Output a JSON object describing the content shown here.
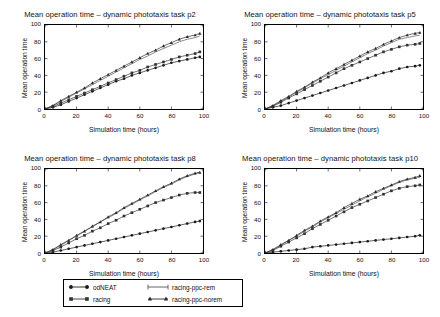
{
  "figure": {
    "axis_labels": {
      "x": "Simulation time (hours)",
      "y": "Mean operation time"
    },
    "xticks": [
      "0",
      "20",
      "40",
      "60",
      "80",
      "100"
    ],
    "yticks": [
      "0",
      "20",
      "40",
      "60",
      "80",
      "100"
    ]
  },
  "legend": {
    "entries": [
      {
        "label": "odNEAT",
        "marker": "filled-circle",
        "color": "#1a1a1a"
      },
      {
        "label": "racing",
        "marker": "filled-square",
        "color": "#333333"
      },
      {
        "label": "racing-ppc-rem",
        "marker": "line-only",
        "color": "#555555"
      },
      {
        "label": "racing-ppc-norem",
        "marker": "filled-triangle",
        "color": "#2b2b2b"
      }
    ]
  },
  "chart_data": [
    {
      "type": "line",
      "title": "Mean operation time – dynamic phototaxis task p2",
      "xlabel": "Simulation time (hours)",
      "ylabel": "Mean operation time",
      "xlim": [
        0,
        100
      ],
      "ylim": [
        0,
        100
      ],
      "grid": false,
      "legend_position": "below-figure",
      "x": [
        0,
        5,
        10,
        15,
        20,
        25,
        30,
        35,
        40,
        45,
        50,
        55,
        60,
        65,
        70,
        75,
        80,
        85,
        90,
        95,
        98
      ],
      "series": [
        {
          "name": "odNEAT",
          "values": [
            0,
            2,
            5,
            9,
            13,
            17,
            21,
            25,
            29,
            33,
            36,
            40,
            43,
            46,
            49,
            52,
            55,
            57,
            59,
            61,
            62
          ]
        },
        {
          "name": "racing",
          "values": [
            0,
            3,
            7,
            11,
            15,
            19,
            23,
            27,
            31,
            35,
            39,
            43,
            46,
            50,
            53,
            56,
            59,
            62,
            64,
            66,
            68
          ]
        },
        {
          "name": "racing-ppc-rem",
          "values": [
            0,
            4,
            9,
            14,
            19,
            24,
            29,
            34,
            39,
            44,
            49,
            54,
            59,
            63,
            68,
            72,
            76,
            80,
            83,
            85,
            87
          ]
        },
        {
          "name": "racing-ppc-norem",
          "values": [
            0,
            4,
            10,
            15,
            20,
            25,
            31,
            36,
            41,
            46,
            51,
            56,
            61,
            66,
            70,
            75,
            79,
            83,
            86,
            88,
            90
          ]
        }
      ]
    },
    {
      "type": "line",
      "title": "Mean operation time – dynamic phototaxis task p5",
      "xlabel": "Simulation time (hours)",
      "ylabel": "Mean operation time",
      "xlim": [
        0,
        100
      ],
      "ylim": [
        0,
        100
      ],
      "grid": false,
      "legend_position": "below-figure",
      "x": [
        0,
        5,
        10,
        15,
        20,
        25,
        30,
        35,
        40,
        45,
        50,
        55,
        60,
        65,
        70,
        75,
        80,
        85,
        90,
        95,
        98
      ],
      "series": [
        {
          "name": "odNEAT",
          "values": [
            0,
            2,
            4,
            7,
            10,
            13,
            16,
            19,
            22,
            25,
            28,
            31,
            34,
            37,
            40,
            43,
            45,
            48,
            50,
            51,
            52
          ]
        },
        {
          "name": "racing",
          "values": [
            0,
            3,
            8,
            13,
            18,
            23,
            28,
            33,
            38,
            43,
            48,
            52,
            56,
            60,
            64,
            68,
            71,
            74,
            76,
            77,
            78
          ]
        },
        {
          "name": "racing-ppc-rem",
          "values": [
            0,
            4,
            9,
            14,
            20,
            25,
            31,
            36,
            41,
            46,
            51,
            56,
            61,
            66,
            70,
            75,
            79,
            83,
            85,
            87,
            88
          ]
        },
        {
          "name": "racing-ppc-norem",
          "values": [
            0,
            4,
            10,
            15,
            21,
            26,
            32,
            37,
            43,
            48,
            53,
            58,
            63,
            68,
            72,
            77,
            81,
            85,
            88,
            90,
            91
          ]
        }
      ]
    },
    {
      "type": "line",
      "title": "Mean operation time – dynamic phototaxis task p8",
      "xlabel": "Simulation time (hours)",
      "ylabel": "Mean operation time",
      "xlim": [
        0,
        100
      ],
      "ylim": [
        0,
        100
      ],
      "grid": false,
      "legend_position": "below-figure",
      "x": [
        0,
        5,
        10,
        15,
        20,
        25,
        30,
        35,
        40,
        45,
        50,
        55,
        60,
        65,
        70,
        75,
        80,
        85,
        90,
        95,
        98
      ],
      "series": [
        {
          "name": "odNEAT",
          "values": [
            0,
            1,
            3,
            5,
            7,
            9,
            11,
            13,
            15,
            17,
            19,
            21,
            23,
            25,
            27,
            29,
            31,
            33,
            35,
            37,
            38
          ]
        },
        {
          "name": "racing",
          "values": [
            0,
            3,
            7,
            12,
            17,
            21,
            26,
            30,
            35,
            39,
            44,
            48,
            52,
            56,
            60,
            63,
            66,
            69,
            71,
            72,
            72
          ]
        },
        {
          "name": "racing-ppc-rem",
          "values": [
            0,
            4,
            9,
            15,
            20,
            26,
            31,
            37,
            42,
            47,
            53,
            58,
            63,
            68,
            73,
            78,
            82,
            87,
            91,
            94,
            96
          ]
        },
        {
          "name": "racing-ppc-norem",
          "values": [
            0,
            4,
            10,
            15,
            21,
            26,
            32,
            37,
            43,
            48,
            54,
            59,
            64,
            69,
            74,
            79,
            83,
            88,
            92,
            95,
            96
          ]
        }
      ]
    },
    {
      "type": "line",
      "title": "Mean operation time – dynamic phototaxis task p10",
      "xlabel": "Simulation time (hours)",
      "ylabel": "Mean operation time",
      "xlim": [
        0,
        100
      ],
      "ylim": [
        0,
        100
      ],
      "grid": false,
      "legend_position": "below-figure",
      "x": [
        0,
        5,
        10,
        15,
        20,
        25,
        30,
        35,
        40,
        45,
        50,
        55,
        60,
        65,
        70,
        75,
        80,
        85,
        90,
        95,
        98
      ],
      "series": [
        {
          "name": "odNEAT",
          "values": [
            0,
            1,
            2,
            3,
            4,
            5,
            7,
            8,
            9,
            10,
            11,
            12,
            13,
            14,
            15,
            16,
            17,
            18,
            19,
            20,
            21
          ]
        },
        {
          "name": "racing",
          "values": [
            0,
            3,
            8,
            13,
            18,
            23,
            29,
            34,
            39,
            44,
            49,
            54,
            58,
            62,
            66,
            70,
            74,
            77,
            79,
            80,
            81
          ]
        },
        {
          "name": "racing-ppc-rem",
          "values": [
            0,
            4,
            9,
            15,
            20,
            26,
            31,
            37,
            42,
            47,
            52,
            57,
            62,
            67,
            71,
            76,
            80,
            84,
            87,
            89,
            90
          ]
        },
        {
          "name": "racing-ppc-norem",
          "values": [
            0,
            4,
            10,
            15,
            21,
            27,
            32,
            38,
            43,
            48,
            54,
            59,
            64,
            68,
            73,
            77,
            81,
            85,
            88,
            90,
            92
          ]
        }
      ]
    }
  ]
}
